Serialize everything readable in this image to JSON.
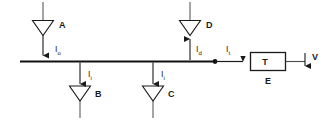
{
  "diagram": {
    "colors": {
      "stroke": "#1a1a1a",
      "bus": "#111111",
      "background": "#ffffff",
      "text": "#1a1a1a"
    },
    "nodes": [
      {
        "id": "A",
        "label": "A",
        "shape": "triangle-down",
        "role": "source"
      },
      {
        "id": "B",
        "label": "B",
        "shape": "triangle-down",
        "role": "load"
      },
      {
        "id": "C",
        "label": "C",
        "shape": "triangle-down",
        "role": "load"
      },
      {
        "id": "D",
        "label": "D",
        "shape": "triangle-down",
        "role": "source"
      },
      {
        "id": "T",
        "label": "T",
        "shape": "rectangle",
        "role": "terminal"
      }
    ],
    "currents": [
      {
        "id": "Io",
        "symbol": "I",
        "subscript": "o",
        "direction": "down",
        "at": "A"
      },
      {
        "id": "Ii_B",
        "symbol": "I",
        "subscript": "i",
        "direction": "down",
        "at": "B"
      },
      {
        "id": "Ii_C",
        "symbol": "I",
        "subscript": "i",
        "direction": "down",
        "at": "C"
      },
      {
        "id": "Id",
        "symbol": "I",
        "subscript": "d",
        "direction": "up",
        "at": "D"
      },
      {
        "id": "It",
        "symbol": "I",
        "subscript": "t",
        "direction": "right",
        "at": "T"
      }
    ],
    "labels": {
      "A": "A",
      "B": "B",
      "C": "C",
      "D": "D",
      "T": "T",
      "E": "E",
      "V": "V",
      "Io_sym": "I",
      "Io_sub": "o",
      "IiB_sym": "I",
      "IiB_sub": "i",
      "IiC_sym": "I",
      "IiC_sub": "i",
      "Id_sym": "I",
      "Id_sub": "d",
      "It_sym": "I",
      "It_sub": "t"
    }
  }
}
